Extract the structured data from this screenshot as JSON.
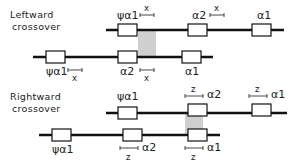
{
  "panels": [
    {
      "title_line1": "Leftward",
      "title_line2": "crossover",
      "top_chromosome": {
        "genes": [
          "ψα1",
          "α2",
          "α1"
        ],
        "scale_label": "x"
      },
      "bottom_chromosome": {
        "genes": [
          "ψα1",
          "α2",
          "α1"
        ],
        "scale_label": "x"
      }
    },
    {
      "title_line1": "Rightward",
      "title_line2": "crossover",
      "top_chromosome": {
        "genes": [
          "ψα1",
          "α2",
          "α1"
        ],
        "scale_label": "z"
      },
      "bottom_chromosome": {
        "genes": [
          "ψα1",
          "α2",
          "α1"
        ],
        "scale_label": "z"
      }
    }
  ]
}
